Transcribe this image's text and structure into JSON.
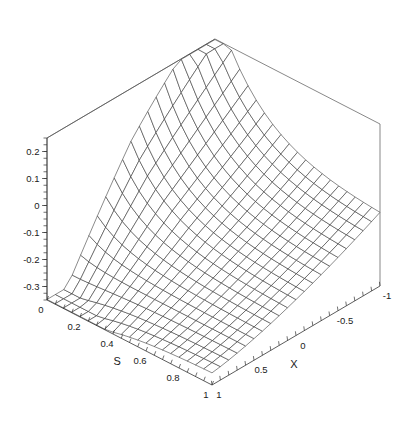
{
  "chart_data": {
    "type": "surface",
    "title": "",
    "subtitle": "",
    "style": "wireframe-mesh",
    "background": "#ffffff",
    "line_color": "#2b2b2b",
    "box_color": "#555555",
    "axis_color": "#333333",
    "grid": false,
    "legend": null,
    "projection": "axonometric",
    "mesh": {
      "n_s": 20,
      "n_x": 20
    },
    "axes": {
      "s": {
        "label": "S",
        "lim": [
          0,
          1
        ],
        "tick_labels": [
          "0",
          "0.2",
          "0.4",
          "0.6",
          "0.8",
          "1"
        ],
        "tick_values": [
          0,
          0.2,
          0.4,
          0.6,
          0.8,
          1
        ],
        "minor_tick_step": 0.05
      },
      "x": {
        "label": "X",
        "lim": [
          1,
          -1
        ],
        "tick_labels": [
          "1",
          "0.5",
          "0",
          "-0.5",
          "-1"
        ],
        "tick_values": [
          1,
          0.5,
          0,
          -0.5,
          -1
        ],
        "minor_tick_step": 0.1
      },
      "z": {
        "label": "",
        "lim": [
          -0.35,
          0.25
        ],
        "tick_labels": [
          "0.2",
          "0.1",
          "0",
          "-0.1",
          "-0.2",
          "-0.3"
        ],
        "tick_values": [
          0.2,
          0.1,
          0,
          -0.1,
          -0.2,
          -0.3
        ],
        "minor_tick_step": 0.025
      }
    },
    "surface_model": {
      "description": "z(s,x) sampled on a 21x21 grid over s in [0,1], x in [-1,1]",
      "coef": {
        "a_peak": 0.255,
        "a_trough": -0.355,
        "decay": 3.6,
        "bowl": 0.3,
        "tilt": 0.115,
        "ridge": 0.055
      }
    },
    "z_values_corners": {
      "s0_x1": -0.355,
      "s0_xm1": 0.255,
      "s1_x1": -0.02,
      "s1_xm1": -0.21
    }
  },
  "geometry": {
    "origin_front": {
      "x": 212,
      "y": 385
    },
    "s_far": {
      "x": 47,
      "y": 300
    },
    "x_far": {
      "x": 380,
      "y": 286
    },
    "z_height": 162,
    "box_top_apex": {
      "x": 207,
      "y": 22
    }
  }
}
